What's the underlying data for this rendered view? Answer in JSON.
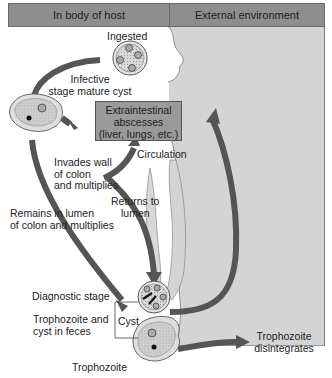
{
  "headers": {
    "left": "In body of host",
    "right": "External environment"
  },
  "labels": {
    "ingested": "Ingested",
    "infective_1": "Infective",
    "infective_2": "stage mature cyst",
    "abscess_1": "Extraintestinal",
    "abscess_2": "abscesses",
    "abscess_3": "(liver, lungs, etc.)",
    "circulation": "Circulation",
    "invades_1": "Invades wall",
    "invades_2": "of colon",
    "invades_3": "and multiplies",
    "returns_1": "Returns to",
    "returns_2": "lumen",
    "remains_1": "Remains in lumen",
    "remains_2": "of colon and multiplies",
    "diagnostic": "Diagnostic stage",
    "feces_1": "Trophozoite and",
    "feces_2": "cyst in feces",
    "cyst": "Cyst",
    "trophozoite": "Trophozoite",
    "disintegrates_1": "Trophozoite",
    "disintegrates_2": "disintegrates"
  },
  "colors": {
    "header_bg": "#8e8e8e",
    "external_bg": "#d4d4d4",
    "arrow": "#555555",
    "abscess_box": "#9a9a9a",
    "cell_fill": "#c9c9c9"
  }
}
